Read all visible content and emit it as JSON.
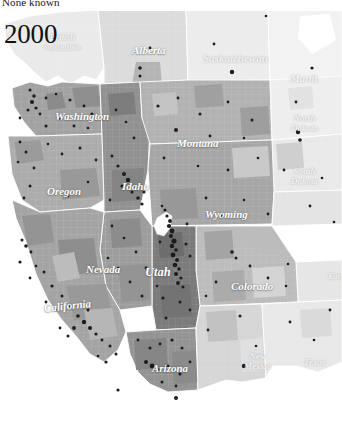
{
  "figure": {
    "caption_cut": "None known",
    "year": "2000",
    "type": "choropleth-dot-density map",
    "region": "Western North America"
  },
  "map": {
    "background_color": "#ffffff",
    "border_color": "#ffffff",
    "marker_color": "#1a1a1a",
    "water_color": "#ffffff",
    "labels": [
      {
        "name": "British Columbia",
        "text": "British\nColumbia",
        "x": 44,
        "y": 22,
        "size": "lbl-md",
        "class": "lbl-faint"
      },
      {
        "name": "Alberta",
        "text": "Alberta",
        "x": 132,
        "y": 34,
        "size": "lbl-lg",
        "class": ""
      },
      {
        "name": "Saskatchewan",
        "text": "Saskatchewan",
        "x": 203,
        "y": 42,
        "size": "lbl-lg",
        "class": "lbl-faint"
      },
      {
        "name": "Manitoba",
        "text": "Manit",
        "x": 290,
        "y": 62,
        "size": "lbl-lg",
        "class": "lbl-faint"
      },
      {
        "name": "Washington",
        "text": "Washington",
        "x": 55,
        "y": 100,
        "size": "lbl-lg",
        "class": ""
      },
      {
        "name": "Montana",
        "text": "Montana",
        "x": 177,
        "y": 127,
        "size": "lbl-lg",
        "class": ""
      },
      {
        "name": "North Dakota",
        "text": "North\nDakota",
        "x": 291,
        "y": 103,
        "size": "lbl-md",
        "class": "lbl-faint"
      },
      {
        "name": "South Dakota",
        "text": "South\nDakota",
        "x": 291,
        "y": 156,
        "size": "lbl-md",
        "class": "lbl-faint"
      },
      {
        "name": "Oregon",
        "text": "Oregon",
        "x": 47,
        "y": 175,
        "size": "lbl-lg",
        "class": ""
      },
      {
        "name": "Idaho",
        "text": "Idaho",
        "x": 122,
        "y": 170,
        "size": "lbl-lg",
        "class": ""
      },
      {
        "name": "Wyoming",
        "text": "Wyoming",
        "x": 205,
        "y": 198,
        "size": "lbl-lg",
        "class": ""
      },
      {
        "name": "Nevada",
        "text": "Nevada",
        "x": 86,
        "y": 253,
        "size": "lbl-lg",
        "class": ""
      },
      {
        "name": "Utah",
        "text": "Utah",
        "x": 145,
        "y": 255,
        "size": "lbl-xl",
        "class": ""
      },
      {
        "name": "Colorado",
        "text": "Colorado",
        "x": 231,
        "y": 270,
        "size": "lbl-lg",
        "class": ""
      },
      {
        "name": "California",
        "text": "California",
        "x": 44,
        "y": 292,
        "size": "lbl-lg",
        "class": "lbl-rot"
      },
      {
        "name": "Arizona",
        "text": "Arizona",
        "x": 152,
        "y": 352,
        "size": "lbl-lg",
        "class": ""
      },
      {
        "name": "New Mexico",
        "text": "New\nMexico",
        "x": 244,
        "y": 341,
        "size": "lbl-md",
        "class": "lbl-faint"
      },
      {
        "name": "Texas",
        "text": "Texas",
        "x": 304,
        "y": 347,
        "size": "lbl-md",
        "class": "lbl-faint"
      },
      {
        "name": "Kansas",
        "text": "Kan",
        "x": 328,
        "y": 262,
        "size": "lbl-sm",
        "class": "lbl-faint"
      }
    ]
  },
  "chart_data": {
    "type": "heatmap",
    "title": "2000",
    "subtitle": "None known",
    "xlabel": "",
    "ylabel": "",
    "legend_position": "top",
    "shading_scale": [
      "#ffffff",
      "#f2f2f2",
      "#e2e2e2",
      "#cfcfcf",
      "#bdbdbd",
      "#a9a9a9",
      "#949494",
      "#7f7f7f",
      "#6b6b6b"
    ],
    "focus_region": "Utah",
    "regions": [
      {
        "name": "British Columbia",
        "shade": "#ededed",
        "markers": 2
      },
      {
        "name": "Alberta",
        "shade": "#d9d9d9",
        "markers": 4
      },
      {
        "name": "Saskatchewan",
        "shade": "#eaeaea",
        "markers": 3
      },
      {
        "name": "Manitoba",
        "shade": "#f0f0f0",
        "markers": 2
      },
      {
        "name": "Washington",
        "shade": "#9f9f9f",
        "markers": 38
      },
      {
        "name": "Oregon",
        "shade": "#a8a8a8",
        "markers": 24
      },
      {
        "name": "Idaho",
        "shade": "#8e8e8e",
        "markers": 31
      },
      {
        "name": "Montana",
        "shade": "#b0b0b0",
        "markers": 14
      },
      {
        "name": "North Dakota",
        "shade": "#ededed",
        "markers": 3
      },
      {
        "name": "South Dakota",
        "shade": "#e8e8e8",
        "markers": 4
      },
      {
        "name": "Wyoming",
        "shade": "#a4a4a4",
        "markers": 11
      },
      {
        "name": "Nevada",
        "shade": "#9a9a9a",
        "markers": 12
      },
      {
        "name": "Utah",
        "shade": "#787878",
        "markers": 96
      },
      {
        "name": "Colorado",
        "shade": "#b5b5b5",
        "markers": 18
      },
      {
        "name": "California",
        "shade": "#a0a0a0",
        "markers": 46
      },
      {
        "name": "Arizona",
        "shade": "#909090",
        "markers": 26
      },
      {
        "name": "New Mexico",
        "shade": "#d2d2d2",
        "markers": 9
      },
      {
        "name": "Texas",
        "shade": "#e6e6e6",
        "markers": 6
      },
      {
        "name": "Kansas",
        "shade": "#e4e4e4",
        "markers": 3
      }
    ]
  }
}
